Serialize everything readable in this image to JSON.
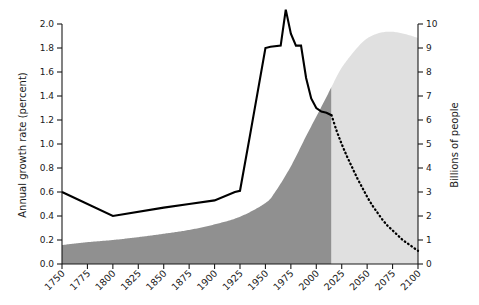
{
  "chart_data": {
    "type": "area",
    "title": "",
    "subtitle": "",
    "xlabel": "",
    "ylabel": "Annual growth rate (percent)",
    "y2label": "Billions of people",
    "grid": false,
    "legend": false,
    "legend_position": "none",
    "xlim": [
      1750,
      2100
    ],
    "ylim": [
      0.0,
      2.0
    ],
    "y2lim": [
      0,
      10
    ],
    "xticks": [
      1750,
      1775,
      1800,
      1825,
      1850,
      1875,
      1900,
      1925,
      1950,
      1975,
      2000,
      2025,
      2050,
      2075,
      2100
    ],
    "xticklabels": [
      "1750",
      "1775",
      "1800",
      "1825",
      "1850",
      "1875",
      "1900",
      "1925",
      "1950",
      "1975",
      "2000",
      "2025",
      "2050",
      "2075",
      "2100"
    ],
    "yticks": [
      0.0,
      0.2,
      0.4,
      0.6,
      0.8,
      1.0,
      1.2,
      1.4,
      1.6,
      1.8,
      2.0
    ],
    "yticklabels": [
      "0.0",
      "0.2",
      "0.4",
      "0.6",
      "0.8",
      "1.0",
      "1.2",
      "1.4",
      "1.6",
      "1.8",
      "2.0"
    ],
    "y2ticks": [
      0,
      1,
      2,
      3,
      4,
      5,
      6,
      7,
      8,
      9,
      10
    ],
    "y2ticklabels": [
      "0",
      "1",
      "2",
      "3",
      "4",
      "5",
      "6",
      "7",
      "8",
      "9",
      "10"
    ],
    "colors": {
      "population_historical": "#909090",
      "population_projected": "#e0e0e0",
      "growth_line": "#000000",
      "axis": "#1a1a1a",
      "background": "#ffffff"
    },
    "split_year": 2015,
    "series": [
      {
        "name": "World population (billions)",
        "type": "area",
        "axis": "right",
        "x": [
          1750,
          1775,
          1800,
          1825,
          1850,
          1875,
          1900,
          1925,
          1950,
          1960,
          1975,
          1990,
          2000,
          2010,
          2015,
          2025,
          2040,
          2050,
          2060,
          2070,
          2080,
          2090,
          2100
        ],
        "values": [
          0.79,
          0.91,
          1.0,
          1.12,
          1.26,
          1.42,
          1.65,
          1.97,
          2.54,
          3.03,
          4.07,
          5.33,
          6.14,
          6.96,
          7.38,
          8.18,
          9.0,
          9.4,
          9.6,
          9.68,
          9.65,
          9.55,
          9.42
        ]
      },
      {
        "name": "Annual growth rate (percent) - observed",
        "type": "line",
        "axis": "left",
        "style": "solid",
        "x": [
          1750,
          1800,
          1850,
          1875,
          1900,
          1920,
          1925,
          1935,
          1950,
          1955,
          1965,
          1970,
          1975,
          1980,
          1985,
          1990,
          1995,
          2000,
          2005,
          2010,
          2015
        ],
        "values": [
          0.6,
          0.4,
          0.47,
          0.5,
          0.53,
          0.6,
          0.61,
          1.08,
          1.8,
          1.81,
          1.82,
          2.12,
          1.92,
          1.82,
          1.82,
          1.55,
          1.38,
          1.3,
          1.27,
          1.26,
          1.24
        ]
      },
      {
        "name": "Annual growth rate (percent) - projected",
        "type": "line",
        "axis": "left",
        "style": "dotted",
        "x": [
          2015,
          2020,
          2025,
          2030,
          2035,
          2040,
          2045,
          2050,
          2055,
          2060,
          2065,
          2070,
          2075,
          2080,
          2085,
          2090,
          2095,
          2100
        ],
        "values": [
          1.24,
          1.11,
          1.0,
          0.9,
          0.81,
          0.72,
          0.64,
          0.56,
          0.49,
          0.43,
          0.37,
          0.32,
          0.28,
          0.24,
          0.2,
          0.17,
          0.14,
          0.11
        ]
      }
    ]
  },
  "figure": {
    "left_axis_title": "Annual growth rate (percent)",
    "right_axis_title": "Billions of people"
  }
}
